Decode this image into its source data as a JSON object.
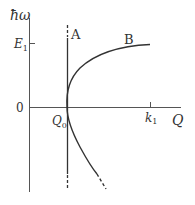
{
  "diagram": {
    "type": "dispersion-diagram",
    "colors": {
      "line": "#333333",
      "axis": "#555555",
      "background": "#ffffff"
    },
    "axes": {
      "y_label": "ħω",
      "x_label": "Q",
      "origin_label": "0",
      "y_tick_label": "E",
      "y_tick_subscript": "1",
      "x_tick_label": "k",
      "x_tick_subscript": "1",
      "q0_label": "Q",
      "q0_subscript": "0"
    },
    "curves": [
      {
        "id": "A",
        "label": "A",
        "description": "vertical line at Q0, dashed at ends"
      },
      {
        "id": "B",
        "label": "B",
        "description": "upper branch curving from Q0 toward E1 at k1"
      },
      {
        "id": "lower",
        "label": "",
        "description": "lower branch descending to the right, dashed at end"
      }
    ]
  }
}
